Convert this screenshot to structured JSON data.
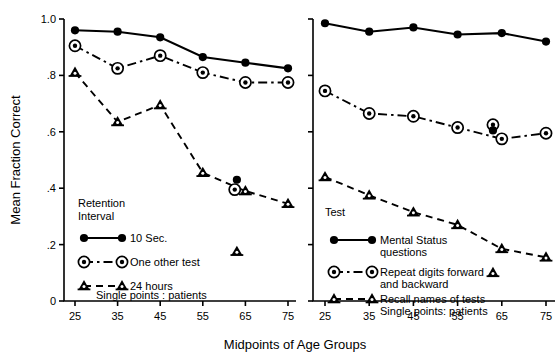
{
  "figure": {
    "ylabel": "Mean Fraction Correct",
    "xlabel": "Midpoints of Age Groups",
    "y_ticks": [
      "1.0",
      ".8",
      ".6",
      ".4",
      ".2",
      "0"
    ],
    "y_tick_values": [
      1.0,
      0.8,
      0.6,
      0.4,
      0.2,
      0
    ],
    "x_ticks": [
      "25",
      "35",
      "45",
      "55",
      "65",
      "75"
    ],
    "ylim": [
      0,
      1.0
    ],
    "xlim": [
      20,
      80
    ],
    "grid": false,
    "line_color": "#000000"
  },
  "left_panel": {
    "legend_title_line1": "Retention",
    "legend_title_line2": "Interval",
    "legend": [
      {
        "label": "10 Sec.",
        "marker": "filled-dot",
        "line": "solid"
      },
      {
        "label": "One other test",
        "marker": "circle-dot",
        "line": "dash-dot"
      },
      {
        "label": "24 hours",
        "marker": "triangle",
        "line": "dashed"
      }
    ],
    "legend_note": "Single points : patients"
  },
  "right_panel": {
    "legend_title_line1": "Test",
    "legend": [
      {
        "label_line1": "Mental Status",
        "label_line2": "questions",
        "marker": "filled-dot",
        "line": "solid"
      },
      {
        "label_line1": "Repeat digits forward",
        "label_line2": "and backward",
        "marker": "circle-dot",
        "line": "dash-dot"
      },
      {
        "label_line1": "Recall names of tests",
        "label_line2": "Single points: patients",
        "marker": "triangle",
        "line": "dashed"
      }
    ]
  },
  "chart_data": [
    {
      "type": "line",
      "panel": "left",
      "title": "",
      "xlabel": "Midpoints of Age Groups",
      "ylabel": "Mean Fraction Correct",
      "xlim": [
        20,
        80
      ],
      "ylim": [
        0,
        1.0
      ],
      "grid": false,
      "legend_position": "lower-left-inside",
      "x": [
        25,
        35,
        45,
        55,
        65,
        75
      ],
      "series": [
        {
          "name": "10 Sec.",
          "marker": "filled-dot",
          "line": "solid",
          "values": [
            0.96,
            0.955,
            0.935,
            0.865,
            0.845,
            0.825
          ]
        },
        {
          "name": "One other test",
          "marker": "circle-dot",
          "line": "dash-dot",
          "values": [
            0.905,
            0.825,
            0.87,
            0.81,
            0.775,
            0.775
          ]
        },
        {
          "name": "24 hours",
          "marker": "triangle",
          "line": "dashed",
          "values": [
            0.81,
            0.635,
            0.695,
            0.455,
            0.39,
            0.345
          ]
        }
      ],
      "single_points_patients": [
        {
          "series": "10 Sec.",
          "x": 63,
          "y": 0.43,
          "marker": "filled-dot"
        },
        {
          "series": "One other test",
          "x": 62.5,
          "y": 0.395,
          "marker": "circle-dot"
        },
        {
          "series": "24 hours",
          "x": 63,
          "y": 0.175,
          "marker": "triangle"
        }
      ]
    },
    {
      "type": "line",
      "panel": "right",
      "title": "",
      "xlabel": "Midpoints of Age Groups",
      "ylabel": "Mean Fraction Correct",
      "xlim": [
        20,
        80
      ],
      "ylim": [
        0,
        1.0
      ],
      "grid": false,
      "legend_position": "lower-left-inside",
      "x": [
        25,
        35,
        45,
        55,
        65,
        75
      ],
      "series": [
        {
          "name": "Mental Status questions",
          "marker": "filled-dot",
          "line": "solid",
          "values": [
            0.985,
            0.955,
            0.97,
            0.945,
            0.95,
            0.92
          ]
        },
        {
          "name": "Repeat digits forward and backward",
          "marker": "circle-dot",
          "line": "dash-dot",
          "values": [
            0.745,
            0.665,
            0.655,
            0.615,
            0.575,
            0.595
          ]
        },
        {
          "name": "Recall names of tests",
          "marker": "triangle",
          "line": "dashed",
          "values": [
            0.44,
            0.375,
            0.315,
            0.27,
            0.185,
            0.155
          ]
        }
      ],
      "single_points_patients": [
        {
          "series": "Repeat digits forward and backward",
          "x": 63,
          "y": 0.625,
          "marker": "circle-dot"
        },
        {
          "series": "Repeat digits forward and backward",
          "x": 63,
          "y": 0.605,
          "marker": "filled-dot"
        },
        {
          "series": "Recall names of tests",
          "x": 63,
          "y": 0.1,
          "marker": "triangle"
        }
      ]
    }
  ]
}
